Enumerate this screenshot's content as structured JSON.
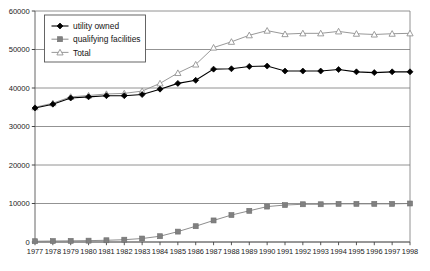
{
  "chart_data": {
    "type": "line",
    "title": "",
    "subtitle": "",
    "xlabel": "",
    "ylabel": "",
    "xlim": [
      1977,
      1998
    ],
    "ylim": [
      0,
      60000
    ],
    "grid": true,
    "grid_axis": "y",
    "legend_position": "top-left",
    "categories": [
      "1977",
      "1978",
      "1979",
      "1980",
      "1981",
      "1982",
      "1983",
      "1984",
      "1985",
      "1986",
      "1987",
      "1988",
      "1989",
      "1990",
      "1991",
      "1992",
      "1993",
      "1994",
      "1995",
      "1996",
      "1997",
      "1998"
    ],
    "x": [
      1977,
      1978,
      1979,
      1980,
      1981,
      1982,
      1983,
      1984,
      1985,
      1986,
      1987,
      1988,
      1989,
      1990,
      1991,
      1992,
      1993,
      1994,
      1995,
      1996,
      1997,
      1998
    ],
    "yticks": [
      0,
      10000,
      20000,
      30000,
      40000,
      50000,
      60000
    ],
    "ytick_labels": [
      "0",
      "10000",
      "20000",
      "30000",
      "40000",
      "50000",
      "60000"
    ],
    "series": [
      {
        "name": "utility owned",
        "marker": "diamond",
        "color": "#000000",
        "values": [
          34800,
          35800,
          37400,
          37700,
          38000,
          38000,
          38300,
          39700,
          41200,
          42000,
          44900,
          45000,
          45600,
          45700,
          44400,
          44400,
          44400,
          44800,
          44200,
          44000,
          44200,
          44200
        ]
      },
      {
        "name": "qualifying facilities",
        "marker": "square",
        "color": "#808080",
        "values": [
          200,
          250,
          300,
          350,
          450,
          600,
          900,
          1500,
          2700,
          4100,
          5600,
          7000,
          8100,
          9200,
          9600,
          9800,
          9800,
          9900,
          9900,
          9900,
          9900,
          10000
        ]
      },
      {
        "name": "Total",
        "marker": "triangle",
        "color": "#8c8c8c",
        "values": [
          35000,
          36050,
          37700,
          38050,
          38450,
          38600,
          39200,
          41200,
          43900,
          46100,
          50500,
          52000,
          53700,
          54900,
          54000,
          54200,
          54200,
          54700,
          54100,
          53900,
          54100,
          54200
        ]
      }
    ],
    "legend": [
      {
        "label": "utility owned",
        "marker": "diamond",
        "color": "#000000"
      },
      {
        "label": "qualifying facilities",
        "marker": "square",
        "color": "#808080"
      },
      {
        "label": "Total",
        "marker": "triangle",
        "color": "#8c8c8c"
      }
    ]
  }
}
